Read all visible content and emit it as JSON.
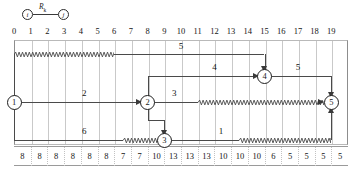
{
  "legend": {
    "left_node": "i",
    "right_node": "j",
    "edge_label": "R",
    "edge_label_sub": "k"
  },
  "chart_data": {
    "type": "diagram",
    "title": "",
    "xlabel": "",
    "ylabel": "",
    "axis_ticks": [
      "0",
      "1",
      "2",
      "3",
      "4",
      "5",
      "6",
      "7",
      "8",
      "9",
      "10",
      "11",
      "12",
      "13",
      "14",
      "15",
      "16",
      "17",
      "18",
      "19"
    ],
    "xlim": [
      0,
      19
    ],
    "grid": true,
    "nodes": [
      {
        "id": "1",
        "label": "1",
        "x": 0,
        "lane": "mid"
      },
      {
        "id": "2",
        "label": "2",
        "x": 8,
        "lane": "mid"
      },
      {
        "id": "3",
        "label": "3",
        "x": 9,
        "lane": "low"
      },
      {
        "id": "4",
        "label": "4",
        "x": 15,
        "lane": "high"
      },
      {
        "id": "5",
        "label": "5",
        "x": 19,
        "lane": "mid"
      }
    ],
    "activities": [
      {
        "from": "1",
        "to": "4",
        "label": "5",
        "start": 0,
        "end": 15,
        "solid_until": 6,
        "float": true,
        "lane": "top"
      },
      {
        "from": "2",
        "to": "4",
        "label": "4",
        "start": 8,
        "end": 15,
        "solid_until": 15,
        "float": false,
        "lane": "high"
      },
      {
        "from": "4",
        "to": "5",
        "label": "5",
        "start": 15,
        "end": 19,
        "solid_until": 19,
        "float": false,
        "lane": "high"
      },
      {
        "from": "1",
        "to": "2",
        "label": "2",
        "start": 0,
        "end": 8,
        "solid_until": 8,
        "float": false,
        "lane": "mid"
      },
      {
        "from": "2",
        "to": "5",
        "label": "3",
        "start": 8,
        "end": 19,
        "solid_until": 11,
        "float": true,
        "lane": "mid"
      },
      {
        "from": "1",
        "to": "3",
        "label": "6",
        "start": 0,
        "end": 9,
        "solid_until": 6.5,
        "float": true,
        "lane": "low"
      },
      {
        "from": "3",
        "to": "5",
        "label": "1",
        "start": 9,
        "end": 19,
        "solid_until": 13.5,
        "float": true,
        "lane": "low"
      }
    ],
    "resource_histogram": {
      "label": "",
      "categories": [
        "0-1",
        "1-2",
        "2-3",
        "3-4",
        "4-5",
        "5-6",
        "6-7",
        "7-8",
        "8-9",
        "9-10",
        "10-11",
        "11-12",
        "12-13",
        "13-14",
        "14-15",
        "15-16",
        "16-17",
        "17-18",
        "18-19",
        "19-20"
      ],
      "values": [
        8,
        8,
        8,
        8,
        8,
        8,
        7,
        7,
        10,
        13,
        13,
        13,
        10,
        10,
        10,
        6,
        5,
        5,
        5,
        5
      ]
    }
  }
}
